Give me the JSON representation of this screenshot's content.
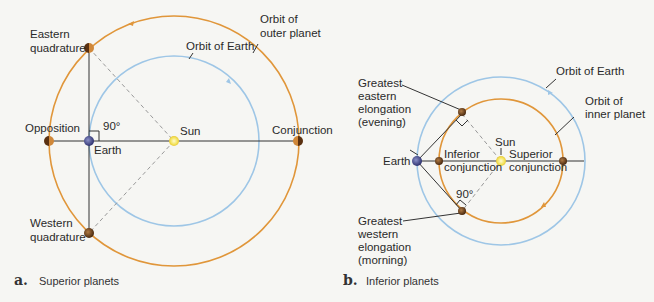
{
  "panels": [
    {
      "id": "a",
      "caption_letter": "a.",
      "caption": "Superior planets",
      "labels": {
        "eastern_quadrature": [
          "Eastern",
          "quadrature"
        ],
        "western_quadrature": [
          "Western",
          "quadrature"
        ],
        "opposition": "Opposition",
        "conjunction": "Conjunction",
        "sun": "Sun",
        "earth": "Earth",
        "angle": "90°",
        "orbit_earth": "Orbit of Earth",
        "orbit_outer": [
          "Orbit of",
          "outer planet"
        ]
      }
    },
    {
      "id": "b",
      "caption_letter": "b.",
      "caption": "Inferior planets",
      "labels": {
        "greatest_eastern": [
          "Greatest",
          "eastern",
          "elongation",
          "(evening)"
        ],
        "greatest_western": [
          "Greatest",
          "western",
          "elongation",
          "(morning)"
        ],
        "earth": "Earth",
        "sun": "Sun",
        "inferior_conjunction": [
          "Inferior",
          "conjunction"
        ],
        "superior_conjunction": [
          "Superior",
          "conjunction"
        ],
        "angle": "90°",
        "orbit_earth": "Orbit of Earth",
        "orbit_inner": [
          "Orbit of",
          "inner planet"
        ]
      }
    }
  ],
  "colors": {
    "earth_orbit": "#9ec6e6",
    "planet_orbit": "#e0963a",
    "sun": "#f3e25a",
    "earth": "#4a4f8a",
    "planet": "#7a4a22",
    "line": "#333333",
    "dashed": "#9a9a9a"
  }
}
